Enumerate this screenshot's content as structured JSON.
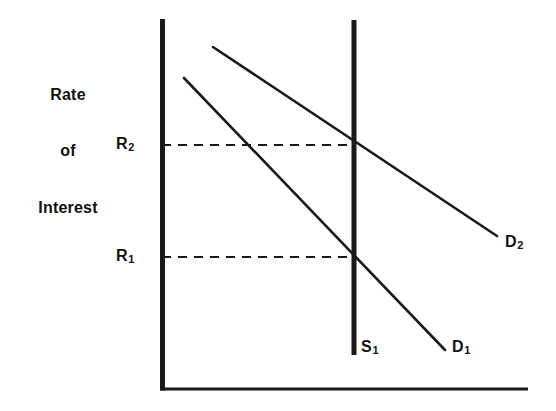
{
  "figure": {
    "kind": "economics-supply-demand-diagram",
    "title": "",
    "background_color": "#ffffff",
    "ink_color": "#1a1a1a"
  },
  "axes": {
    "y_axis_label": {
      "line1": "Rate",
      "line2": "of",
      "line3": "Interest"
    },
    "x_axis_label": "",
    "y_axis": {
      "x": 162,
      "y_top": 19,
      "y_bottom": 391,
      "width": 5
    },
    "x_axis": {
      "y": 389,
      "x_left": 160,
      "x_right": 528,
      "width": 3
    }
  },
  "tick_labels": [
    {
      "name": "r2",
      "base": "R",
      "sub": "2",
      "value_y": 145
    },
    {
      "name": "r1",
      "base": "R",
      "sub": "1",
      "value_y": 257
    }
  ],
  "curves": {
    "supply": {
      "name": "S1",
      "base": "S",
      "sub": "1",
      "type": "vertical-supply",
      "x": 354,
      "y_top": 20,
      "y_bottom": 355,
      "width": 5
    },
    "demand_1": {
      "name": "D1",
      "base": "D",
      "sub": "1",
      "type": "downward-sloping-demand",
      "x1": 184,
      "y1": 78,
      "x2": 445,
      "y2": 350,
      "width": 2.6
    },
    "demand_2": {
      "name": "D2",
      "base": "D",
      "sub": "2",
      "type": "downward-sloping-demand-shifted-right",
      "x1": 213,
      "y1": 47,
      "x2": 497,
      "y2": 236,
      "width": 2.6
    }
  },
  "guide_lines": [
    {
      "name": "r2-guide",
      "y": 145,
      "x1": 162,
      "x2": 356,
      "style": "dashed"
    },
    {
      "name": "r1-guide",
      "y": 257,
      "x1": 162,
      "x2": 356,
      "style": "dashed"
    }
  ],
  "equilibria": [
    {
      "name": "equilibrium-r2",
      "x": 354,
      "y": 145,
      "rate_label": "R2",
      "demand_curve": "D2",
      "supply_curve": "S1"
    },
    {
      "name": "equilibrium-r1",
      "x": 354,
      "y": 257,
      "rate_label": "R1",
      "demand_curve": "D1",
      "supply_curve": "S1"
    }
  ]
}
